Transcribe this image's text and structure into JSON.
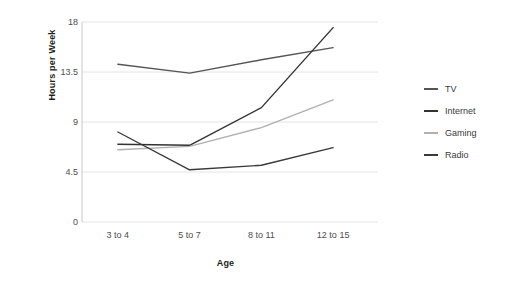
{
  "chart_data": {
    "type": "line",
    "title": "",
    "xlabel": "Age",
    "ylabel": "Hours per Week",
    "categories": [
      "3 to 4",
      "5 to 7",
      "8 to 11",
      "12 to 15"
    ],
    "yticks": [
      "0",
      "4.5",
      "9",
      "13.5",
      "18"
    ],
    "ylim": [
      0,
      18
    ],
    "grid": true,
    "legend_position": "right",
    "series": [
      {
        "name": "TV",
        "values": [
          14.2,
          13.4,
          14.6,
          15.7
        ],
        "color": "#555555"
      },
      {
        "name": "Internet",
        "values": [
          7.0,
          6.9,
          10.3,
          17.5
        ],
        "color": "#333333"
      },
      {
        "name": "Gaming",
        "values": [
          6.5,
          6.8,
          8.5,
          11.0
        ],
        "color": "#b0b0b0"
      },
      {
        "name": "Radio",
        "values": [
          8.1,
          4.7,
          5.1,
          6.7
        ],
        "color": "#3a3a3a"
      }
    ]
  },
  "legend": {
    "items": [
      {
        "label": "TV"
      },
      {
        "label": "Internet"
      },
      {
        "label": "Gaming"
      },
      {
        "label": "Radio"
      }
    ]
  },
  "axes": {
    "x_title": "Age",
    "y_title": "Hours per Week"
  },
  "colors": {
    "gridline": "#e4e4e4",
    "axis": "#c8c8c8",
    "tick_text": "#4d4d4d",
    "title_text": "#231f20",
    "background": "#ffffff"
  }
}
